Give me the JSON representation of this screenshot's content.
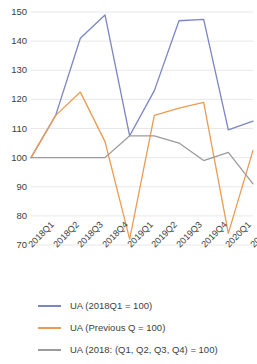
{
  "chart_data": {
    "type": "line",
    "title": "",
    "xlabel": "",
    "ylabel": "",
    "grid": true,
    "legend_position": "bottom",
    "ylim": [
      70,
      150
    ],
    "ytick_step": 10,
    "yticks": [
      150,
      140,
      130,
      120,
      110,
      100,
      90,
      80,
      70
    ],
    "categories": [
      "2018Q1",
      "2018Q2",
      "2018Q3",
      "2018Q4",
      "2019Q1",
      "2019Q2",
      "2019Q3",
      "2019Q4",
      "2020Q1",
      "2020Q2"
    ],
    "series": [
      {
        "name": "UA (2018Q1 = 100)",
        "color": "#7b85c4",
        "values": [
          100,
          114.5,
          141,
          149,
          107.5,
          123,
          147,
          147.5,
          109.5,
          112.5
        ]
      },
      {
        "name": "UA (Previous Q = 100)",
        "color": "#eb9b52",
        "values": [
          100,
          114.5,
          122.5,
          105.5,
          72,
          114.5,
          117,
          119,
          74,
          102.5
        ]
      },
      {
        "name": "UA (2018: (Q1, Q2, Q3, Q4) = 100)",
        "color": "#9b9b9b",
        "values": [
          100,
          100,
          100,
          100,
          107.5,
          107.5,
          105,
          99,
          101.8,
          91
        ]
      }
    ]
  },
  "legend": {
    "items": [
      {
        "label": "UA (2018Q1 = 100)",
        "color": "#7b85c4"
      },
      {
        "label": "UA (Previous Q = 100)",
        "color": "#eb9b52"
      },
      {
        "label": "UA (2018: (Q1, Q2, Q3, Q4) = 100)",
        "color": "#9b9b9b"
      }
    ]
  }
}
